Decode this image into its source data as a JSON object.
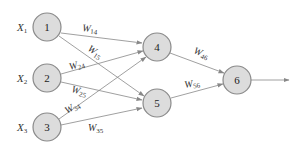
{
  "diagram": {
    "type": "neural-network",
    "colors": {
      "node_fill": "#dcdcdc",
      "node_stroke": "#8a8a8a",
      "edge": "#888888",
      "text": "#333333"
    },
    "inputs": [
      {
        "name": "X",
        "sub": "1",
        "node": "1"
      },
      {
        "name": "X",
        "sub": "2",
        "node": "2"
      },
      {
        "name": "X",
        "sub": "3",
        "node": "3"
      }
    ],
    "nodes": [
      {
        "id": "1",
        "label": "1",
        "layer": "input"
      },
      {
        "id": "2",
        "label": "2",
        "layer": "input"
      },
      {
        "id": "3",
        "label": "3",
        "layer": "input"
      },
      {
        "id": "4",
        "label": "4",
        "layer": "hidden"
      },
      {
        "id": "5",
        "label": "5",
        "layer": "hidden"
      },
      {
        "id": "6",
        "label": "6",
        "layer": "output"
      }
    ],
    "edges": [
      {
        "from": "1",
        "to": "4",
        "w": "W",
        "sub": "14"
      },
      {
        "from": "1",
        "to": "5",
        "w": "W",
        "sub": "15"
      },
      {
        "from": "2",
        "to": "4",
        "w": "W",
        "sub": "24"
      },
      {
        "from": "2",
        "to": "5",
        "w": "W",
        "sub": "25"
      },
      {
        "from": "3",
        "to": "4",
        "w": "W",
        "sub": "34"
      },
      {
        "from": "3",
        "to": "5",
        "w": "W",
        "sub": "35"
      },
      {
        "from": "4",
        "to": "6",
        "w": "W",
        "sub": "46"
      },
      {
        "from": "5",
        "to": "6",
        "w": "W",
        "sub": "56"
      }
    ],
    "output_arrow": {
      "from": "6"
    }
  }
}
